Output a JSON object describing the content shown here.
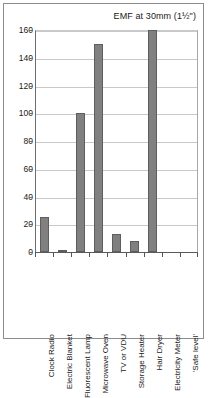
{
  "chart_data": {
    "type": "bar",
    "title": "EMF at 30mm (1½\")",
    "xlabel": "",
    "ylabel": "",
    "ylim": [
      0,
      160
    ],
    "yticks": [
      0,
      20,
      40,
      60,
      80,
      100,
      120,
      140,
      160
    ],
    "grid": true,
    "legend": "none",
    "bar_color": "#808080",
    "bar_border_color": "#5e5e5e",
    "categories": [
      "Clock Radio",
      "Electric Blanket",
      "Fluorescent Lamp",
      "Microwave Oven",
      "TV or VDU",
      "Storage Heater",
      "Hair Dryer",
      "Electricity Meter",
      "'Safe level'"
    ],
    "values": [
      25,
      1,
      100,
      150,
      13,
      8,
      160,
      0,
      0
    ]
  }
}
